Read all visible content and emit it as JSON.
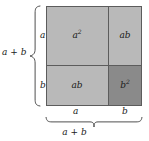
{
  "figure": {
    "square": {
      "outline_color": "#5c5c5c",
      "regions": [
        {
          "id": "a-squared",
          "label_base": "a",
          "label_sup": "2",
          "position": "top-left",
          "fill": "#b9b9b9"
        },
        {
          "id": "ab-top",
          "label_base": "ab",
          "label_sup": "",
          "position": "top-right",
          "fill": "#b9b9b9"
        },
        {
          "id": "ab-bottom",
          "label_base": "ab",
          "label_sup": "",
          "position": "bottom-left",
          "fill": "#b9b9b9"
        },
        {
          "id": "b-squared",
          "label_base": "b",
          "label_sup": "2",
          "position": "bottom-right",
          "fill": "#8a8a8a"
        }
      ]
    },
    "left_axis": {
      "total_label": "a + b",
      "segments": [
        {
          "label": "a",
          "position": "upper"
        },
        {
          "label": "b",
          "position": "lower"
        }
      ]
    },
    "bottom_axis": {
      "total_label": "a + b",
      "segments": [
        {
          "label": "a",
          "position": "left"
        },
        {
          "label": "b",
          "position": "right"
        }
      ]
    }
  }
}
